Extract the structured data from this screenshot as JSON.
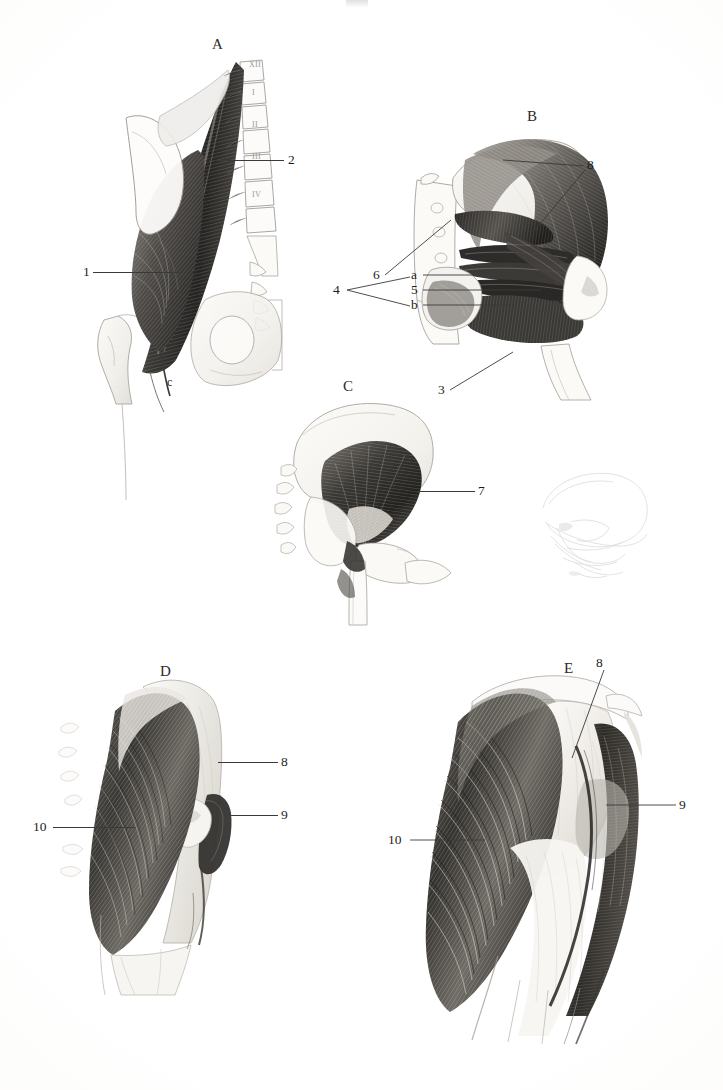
{
  "plate": {
    "background_color": "#fdfdfc",
    "ink_color": "#1d1d1d",
    "top_mark_label": "",
    "caption": ""
  },
  "panels": [
    {
      "id": "A",
      "letter": "A",
      "subject": "lateral view of lumbar spine, ilium and femur with psoas major and iliacus muscles",
      "vertebra_labels": [
        "XII",
        "I",
        "II",
        "III",
        "IV"
      ],
      "labels": [
        {
          "key": "1",
          "text": "1"
        },
        {
          "key": "2",
          "text": "2"
        },
        {
          "key": "c",
          "text": "c"
        }
      ]
    },
    {
      "id": "B",
      "letter": "B",
      "subject": "posterior hip with deep rotator muscles, sacrum and proximal femur",
      "labels": [
        {
          "key": "8",
          "text": "8"
        },
        {
          "key": "6",
          "text": "6"
        },
        {
          "key": "a",
          "text": "a"
        },
        {
          "key": "5",
          "text": "5"
        },
        {
          "key": "b",
          "text": "b"
        },
        {
          "key": "4",
          "text": "4"
        },
        {
          "key": "3",
          "text": "3"
        }
      ],
      "bracket": {
        "label": "4",
        "members": [
          "a",
          "b"
        ]
      }
    },
    {
      "id": "C",
      "letter": "C",
      "subject": "lateral pelvis with gluteus minimus and proximal femur",
      "labels": [
        {
          "key": "7",
          "text": "7"
        }
      ]
    },
    {
      "id": "C-ghost",
      "letter": "",
      "subject": "faint offset ghost print of pelvis sketch",
      "labels": []
    },
    {
      "id": "D",
      "letter": "D",
      "subject": "gluteal region, superficial gluteus medius and tensor fasciae latae",
      "labels": [
        {
          "key": "8",
          "text": "8"
        },
        {
          "key": "9",
          "text": "9"
        },
        {
          "key": "10",
          "text": "10"
        }
      ]
    },
    {
      "id": "E",
      "letter": "E",
      "subject": "gluteal region enlarged, gluteus maximus and iliotibial tract",
      "labels": [
        {
          "key": "8",
          "text": "8"
        },
        {
          "key": "9",
          "text": "9"
        },
        {
          "key": "10",
          "text": "10"
        }
      ]
    }
  ]
}
